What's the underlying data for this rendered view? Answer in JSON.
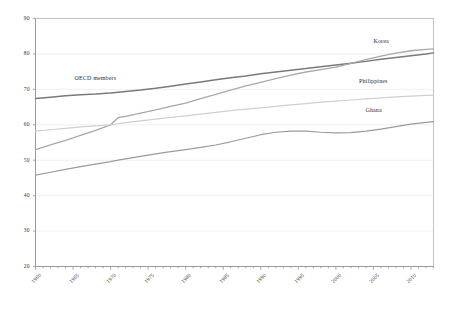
{
  "chart_data": {
    "type": "line",
    "title": "",
    "subtitle": "",
    "xlabel": "",
    "ylabel": "",
    "xlim": [
      1960,
      2013
    ],
    "ylim": [
      20,
      90
    ],
    "yticks": [
      20,
      30,
      40,
      50,
      60,
      70,
      80,
      90
    ],
    "xticks": [
      1960,
      1965,
      1970,
      1975,
      1980,
      1985,
      1990,
      1995,
      2000,
      2005,
      2010
    ],
    "xtick_labels": [
      "1960",
      "1965",
      "1970",
      "1975",
      "1980",
      "1985",
      "1990",
      "1995",
      "2000",
      "2005",
      "2010"
    ],
    "ytick_labels": [
      "20",
      "30",
      "40",
      "50",
      "60",
      "70",
      "80",
      "90"
    ],
    "x_minor_tick_step": 1,
    "grid": true,
    "grid_axis": "y",
    "legend": "inline-annotations",
    "legend_position": "none",
    "x": [
      1960,
      1962,
      1964,
      1966,
      1968,
      1970,
      1971,
      1972,
      1974,
      1976,
      1978,
      1980,
      1982,
      1984,
      1986,
      1988,
      1990,
      1992,
      1994,
      1996,
      1998,
      2000,
      2002,
      2004,
      2006,
      2008,
      2010,
      2012,
      2013
    ],
    "series": [
      {
        "name": "OECD members",
        "color": "#7a7a7a",
        "width": 1.5,
        "label_x": 1968,
        "label_y": 73.0,
        "values": [
          67.4,
          67.8,
          68.2,
          68.5,
          68.7,
          69.0,
          69.2,
          69.4,
          69.8,
          70.3,
          70.9,
          71.5,
          72.1,
          72.7,
          73.3,
          73.8,
          74.4,
          74.9,
          75.4,
          75.9,
          76.4,
          76.9,
          77.4,
          77.9,
          78.5,
          79.0,
          79.5,
          80.0,
          80.3
        ]
      },
      {
        "name": "Korea",
        "color": "#a8a8a8",
        "width": 1.3,
        "label_x": 2006,
        "label_y": 83.5,
        "values": [
          53.0,
          54.3,
          55.6,
          57.0,
          58.4,
          60.0,
          62.0,
          62.4,
          63.3,
          64.2,
          65.2,
          66.1,
          67.4,
          68.6,
          69.8,
          71.0,
          72.0,
          73.0,
          74.0,
          74.9,
          75.6,
          76.3,
          77.3,
          78.4,
          79.4,
          80.2,
          80.9,
          81.3,
          81.4
        ]
      },
      {
        "name": "Philippines",
        "color": "#d0d0d0",
        "width": 1.2,
        "label_x": 2005,
        "label_y": 72.0,
        "values": [
          58.2,
          58.6,
          59.0,
          59.4,
          59.7,
          60.0,
          60.3,
          60.6,
          61.1,
          61.6,
          62.1,
          62.5,
          63.0,
          63.5,
          64.0,
          64.4,
          64.8,
          65.2,
          65.6,
          66.0,
          66.4,
          66.7,
          67.0,
          67.3,
          67.6,
          67.9,
          68.1,
          68.3,
          68.4
        ]
      },
      {
        "name": "Ghana",
        "color": "#9b9b9b",
        "width": 1.2,
        "label_x": 2005,
        "label_y": 64.0,
        "values": [
          45.8,
          46.6,
          47.4,
          48.2,
          48.9,
          49.6,
          50.0,
          50.4,
          51.1,
          51.8,
          52.4,
          53.0,
          53.6,
          54.3,
          55.2,
          56.2,
          57.2,
          57.9,
          58.2,
          58.2,
          57.9,
          57.7,
          57.8,
          58.2,
          58.8,
          59.5,
          60.2,
          60.7,
          60.9
        ]
      }
    ]
  },
  "axes": {
    "axis_color": "#909090",
    "grid_color": "#e8e8e8",
    "border_color": "#b4b4b4",
    "text_color": "#3a3a3a"
  }
}
